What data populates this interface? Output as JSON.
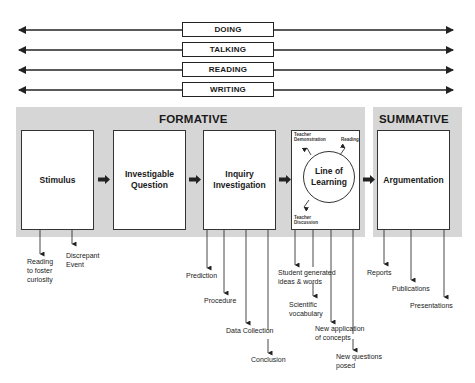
{
  "modes": [
    "DOING",
    "TALKING",
    "READING",
    "WRITING"
  ],
  "formative": {
    "title": "FORMATIVE",
    "stages": [
      {
        "label": "Stimulus",
        "outputs": [
          "Reading to foster curiosity",
          "Discrepant Event"
        ]
      },
      {
        "label": "Investigable Question",
        "outputs": []
      },
      {
        "label": "Inquiry Investigation",
        "outputs": [
          "Prediction",
          "Procedure",
          "Data Collection",
          "Conclusion"
        ]
      },
      {
        "label": "Line of Learning",
        "outputs": [
          "Student generated ideas & words",
          "Scientific vocabulary",
          "New application of concepts",
          "New questions posed"
        ]
      }
    ],
    "line_of_learning_inputs": {
      "teacher_demonstration": "Teacher Demonstration",
      "reading": "Reading",
      "teacher_discussion": "Teacher Discussion"
    }
  },
  "summative": {
    "title": "SUMMATIVE",
    "stages": [
      {
        "label": "Argumentation",
        "outputs": [
          "Reports",
          "Publications",
          "Presentations"
        ]
      }
    ]
  },
  "labels": {
    "stimulus_out_1_l1": "Reading",
    "stimulus_out_1_l2": "to foster",
    "stimulus_out_1_l3": "curiosity",
    "stimulus_out_2_l1": "Discrepant",
    "stimulus_out_2_l2": "Event",
    "iq_l1": "Investigable",
    "iq_l2": "Question",
    "ii_l1": "Inquiry",
    "ii_l2": "Investigation",
    "lol_l1": "Line of",
    "lol_l2": "Learning",
    "td_l1": "Teacher",
    "td_l2": "Demonstration",
    "tdis_l1": "Teacher",
    "tdis_l2": "Discussion",
    "sg_l1": "Student generated",
    "sg_l2": "ideas & words",
    "sv_l1": "Scientific",
    "sv_l2": "vocabulary",
    "na_l1": "New application",
    "na_l2": "of concepts",
    "nq_l1": "New questions",
    "nq_l2": "posed"
  }
}
